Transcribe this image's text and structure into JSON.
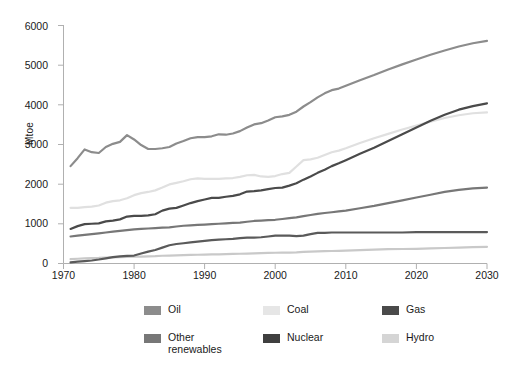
{
  "chart_data": {
    "type": "line",
    "title": "",
    "xlabel": "",
    "ylabel": "Mtoe",
    "xlim": [
      1970,
      2030
    ],
    "ylim": [
      0,
      6000
    ],
    "grid": false,
    "legend_position": "bottom",
    "x_ticks": [
      "1970",
      "1980",
      "1990",
      "2000",
      "2010",
      "2020",
      "2030"
    ],
    "y_ticks": [
      "0",
      "1000",
      "2000",
      "3000",
      "4000",
      "5000",
      "6000"
    ],
    "x": [
      1971,
      1972,
      1973,
      1974,
      1975,
      1976,
      1977,
      1978,
      1979,
      1980,
      1981,
      1982,
      1983,
      1984,
      1985,
      1986,
      1987,
      1988,
      1989,
      1990,
      1991,
      1992,
      1993,
      1994,
      1995,
      1996,
      1997,
      1998,
      1999,
      2000,
      2001,
      2002,
      2003,
      2004,
      2005,
      2006,
      2007,
      2008,
      2009,
      2010,
      2012,
      2014,
      2016,
      2018,
      2020,
      2022,
      2024,
      2026,
      2028,
      2030
    ],
    "series": [
      {
        "name": "Oil",
        "color": "#8c8c8c",
        "values": [
          2450,
          2650,
          2870,
          2800,
          2780,
          2930,
          3010,
          3060,
          3230,
          3120,
          2980,
          2880,
          2880,
          2900,
          2930,
          3020,
          3080,
          3150,
          3180,
          3180,
          3200,
          3250,
          3240,
          3270,
          3330,
          3420,
          3500,
          3530,
          3600,
          3680,
          3700,
          3740,
          3820,
          3950,
          4060,
          4180,
          4280,
          4360,
          4400,
          4470,
          4610,
          4740,
          4880,
          5010,
          5130,
          5250,
          5360,
          5460,
          5540,
          5600
        ]
      },
      {
        "name": "Coal",
        "color": "#e0e0e0",
        "values": [
          1400,
          1400,
          1420,
          1430,
          1460,
          1530,
          1570,
          1590,
          1640,
          1720,
          1770,
          1800,
          1840,
          1910,
          1990,
          2030,
          2070,
          2120,
          2140,
          2130,
          2130,
          2130,
          2140,
          2150,
          2180,
          2220,
          2230,
          2190,
          2180,
          2200,
          2250,
          2280,
          2440,
          2600,
          2620,
          2660,
          2730,
          2800,
          2840,
          2900,
          3030,
          3150,
          3260,
          3370,
          3470,
          3570,
          3660,
          3730,
          3780,
          3800
        ]
      },
      {
        "name": "Gas",
        "color": "#4a4a4a",
        "values": [
          870,
          940,
          990,
          1000,
          1010,
          1060,
          1080,
          1110,
          1180,
          1200,
          1200,
          1210,
          1240,
          1330,
          1380,
          1400,
          1460,
          1520,
          1570,
          1610,
          1650,
          1650,
          1680,
          1700,
          1740,
          1810,
          1820,
          1840,
          1870,
          1900,
          1910,
          1960,
          2020,
          2110,
          2190,
          2280,
          2360,
          2450,
          2520,
          2600,
          2760,
          2910,
          3080,
          3250,
          3420,
          3590,
          3740,
          3870,
          3960,
          4030
        ]
      },
      {
        "name": "Other renewables",
        "color": "#777777",
        "values": [
          680,
          700,
          720,
          740,
          760,
          780,
          800,
          820,
          840,
          860,
          870,
          880,
          890,
          900,
          910,
          930,
          950,
          960,
          970,
          980,
          990,
          1000,
          1010,
          1020,
          1030,
          1050,
          1070,
          1080,
          1090,
          1100,
          1120,
          1140,
          1160,
          1190,
          1220,
          1250,
          1270,
          1290,
          1310,
          1330,
          1390,
          1450,
          1520,
          1590,
          1660,
          1730,
          1800,
          1850,
          1890,
          1910
        ]
      },
      {
        "name": "Nuclear",
        "color": "#5a5a5a",
        "values": [
          30,
          45,
          60,
          75,
          100,
          130,
          160,
          180,
          190,
          200,
          250,
          300,
          340,
          400,
          460,
          490,
          510,
          530,
          550,
          570,
          590,
          600,
          610,
          620,
          640,
          650,
          650,
          660,
          680,
          700,
          700,
          700,
          690,
          700,
          740,
          770,
          770,
          780,
          780,
          780,
          780,
          780,
          780,
          780,
          790,
          790,
          790,
          790,
          790,
          790
        ]
      },
      {
        "name": "Hydro",
        "color": "#c9c9c9",
        "values": [
          110,
          120,
          130,
          135,
          140,
          150,
          155,
          160,
          165,
          170,
          175,
          180,
          185,
          195,
          200,
          205,
          210,
          215,
          220,
          225,
          230,
          230,
          235,
          240,
          245,
          250,
          255,
          260,
          265,
          270,
          275,
          275,
          280,
          290,
          300,
          305,
          310,
          315,
          320,
          325,
          335,
          350,
          360,
          365,
          370,
          380,
          390,
          400,
          410,
          420
        ]
      }
    ]
  },
  "axis": {
    "y_title": "Mtoe"
  },
  "legend": {
    "items": [
      {
        "label": "Oil",
        "color": "#8c8c8c",
        "name": "oil"
      },
      {
        "label": "Coal",
        "color": "#e6e6e6",
        "name": "coal"
      },
      {
        "label": "Gas",
        "color": "#4a4a4a",
        "name": "gas"
      },
      {
        "label": "Other\nrenewables",
        "color": "#777777",
        "name": "other-renewables"
      },
      {
        "label": "Nuclear",
        "color": "#3f3f3f",
        "name": "nuclear"
      },
      {
        "label": "Hydro",
        "color": "#d5d5d5",
        "name": "hydro"
      }
    ]
  },
  "colors": {
    "axis_line": "#b0b0b0",
    "text": "#1a1a1a",
    "background": "#ffffff"
  }
}
